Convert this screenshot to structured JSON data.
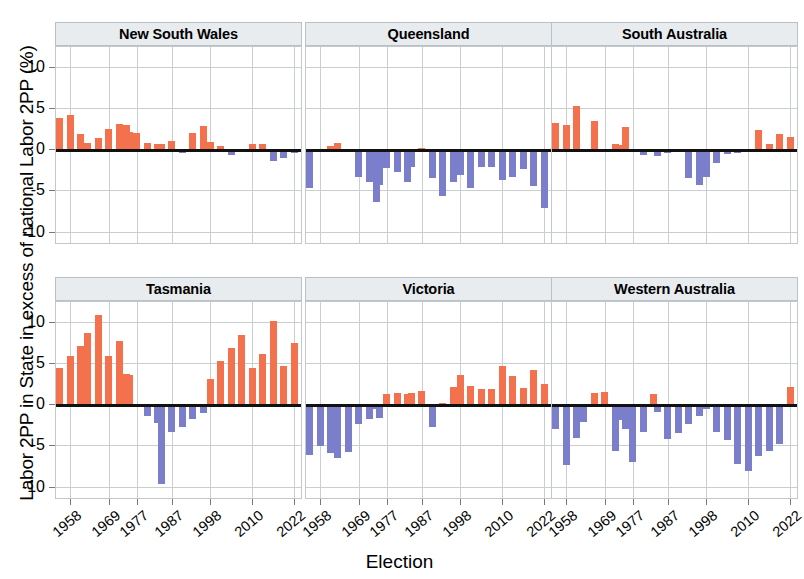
{
  "chart_data": {
    "type": "bar",
    "title": "",
    "xlabel": "Election",
    "ylabel": "Labor 2PP in State in excess of national Labor 2PP (%)",
    "ylim": [
      -11.5,
      12.5
    ],
    "yticks": [
      10,
      5,
      0,
      -5,
      -10
    ],
    "ytick_labels": [
      "10",
      "5",
      "0",
      "-5",
      "-10"
    ],
    "xticks": [
      1958,
      1969,
      1977,
      1987,
      1998,
      2010,
      2022
    ],
    "xtick_labels": [
      "1958",
      "1969",
      "1977",
      "1987",
      "1998",
      "2010",
      "2022"
    ],
    "xlim": [
      1954,
      2024
    ],
    "grid": true,
    "legend": "none",
    "colors": {
      "positive": "#f4714e",
      "negative": "#7b7fcb",
      "zero_line": "#111111",
      "grid": "#c9ced3",
      "strip_background": "#e8ecef",
      "panel_border": "#c3c8cc"
    },
    "facet_layout": {
      "rows": 2,
      "cols": 3
    },
    "elections": [
      1955,
      1958,
      1961,
      1963,
      1966,
      1969,
      1972,
      1974,
      1975,
      1977,
      1980,
      1983,
      1984,
      1987,
      1990,
      1993,
      1996,
      1998,
      2001,
      2004,
      2007,
      2010,
      2013,
      2016,
      2019,
      2022
    ],
    "panels": [
      {
        "name": "New South Wales",
        "values": [
          3.9,
          4.2,
          1.9,
          0.9,
          1.5,
          2.6,
          3.2,
          3.0,
          2.2,
          2.1,
          0.9,
          0.8,
          0.8,
          1.1,
          -0.4,
          2.1,
          2.9,
          1.0,
          0.5,
          -0.6,
          0.1,
          0.7,
          0.8,
          -1.3,
          -0.9,
          -0.4
        ]
      },
      {
        "name": "Queensland",
        "values": [
          -4.6,
          0.0,
          0.5,
          0.9,
          0.0,
          -3.3,
          -3.9,
          -6.3,
          -4.2,
          -2.2,
          -2.6,
          -3.9,
          -2.0,
          0.2,
          -3.4,
          -5.5,
          -3.9,
          -3.0,
          -4.6,
          -2.1,
          -2.0,
          -3.6,
          -3.2,
          -2.3,
          -4.3,
          -7.0
        ]
      },
      {
        "name": "South Australia",
        "values": [
          3.3,
          3.1,
          5.3,
          0.0,
          3.5,
          0.0,
          0.8,
          0.6,
          2.8,
          0.0,
          -0.6,
          0.0,
          -0.7,
          -0.3,
          -0.2,
          -3.4,
          -4.2,
          -3.2,
          -1.6,
          -0.5,
          -0.3,
          0.0,
          2.4,
          0.8,
          1.9,
          1.6
        ]
      },
      {
        "name": "Tasmania",
        "values": [
          4.5,
          6.0,
          7.2,
          8.7,
          10.9,
          6.0,
          7.8,
          3.8,
          3.7,
          0.0,
          -1.3,
          -2.2,
          -9.6,
          -3.2,
          -2.7,
          -1.7,
          -1.0,
          3.2,
          5.4,
          6.9,
          8.5,
          4.5,
          6.2,
          10.2,
          4.8,
          7.5
        ]
      },
      {
        "name": "Victoria",
        "values": [
          -6.1,
          -4.9,
          -5.8,
          -6.4,
          -5.7,
          -2.3,
          -1.7,
          -0.5,
          -1.6,
          1.4,
          1.5,
          1.4,
          1.5,
          1.7,
          -2.6,
          0.3,
          2.2,
          3.6,
          2.3,
          2.0,
          1.9,
          4.7,
          3.5,
          2.1,
          4.3,
          2.6
        ]
      },
      {
        "name": "Western Australia",
        "values": [
          -2.9,
          -7.3,
          -4.0,
          -2.0,
          1.5,
          1.6,
          -5.6,
          -1.8,
          -2.9,
          -6.9,
          -3.3,
          1.3,
          -0.8,
          -4.1,
          -3.4,
          -2.3,
          -1.3,
          -0.5,
          -3.3,
          -4.2,
          -7.1,
          -8.0,
          -6.2,
          -5.5,
          -4.7,
          2.2
        ]
      }
    ]
  }
}
